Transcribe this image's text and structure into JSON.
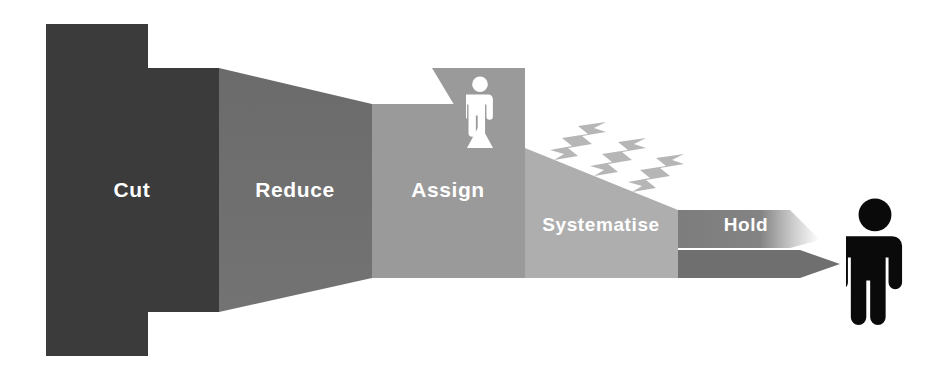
{
  "diagram": {
    "background": "#ffffff",
    "stages": [
      {
        "id": "cut",
        "label": "Cut",
        "color": "#3b3b3b",
        "label_x": 132,
        "label_y": 197
      },
      {
        "id": "reduce",
        "label": "Reduce",
        "color": "#6f6f6f",
        "label_x": 295,
        "label_y": 197
      },
      {
        "id": "assign",
        "label": "Assign",
        "color": "#9a9a9a",
        "label_x": 448,
        "label_y": 197
      },
      {
        "id": "systematise",
        "label": "Systematise",
        "color": "#aeaeae",
        "label_x": 601,
        "label_y": 230
      },
      {
        "id": "hold",
        "label": "Hold",
        "color": "#7d7d7d",
        "label_x": 746,
        "label_y": 230
      }
    ],
    "figures": [
      {
        "id": "small-person",
        "color": "#ffffff",
        "x": 478,
        "y": 74,
        "scale": 0.46
      },
      {
        "id": "large-person",
        "color": "#0a0a0a",
        "x": 873,
        "y": 196,
        "scale": 1.0
      }
    ],
    "bolts": {
      "id": "lightning-bolts",
      "color": "#b6b6b6",
      "count": 3,
      "positions": [
        {
          "x": 560,
          "y": 126
        },
        {
          "x": 600,
          "y": 142
        },
        {
          "x": 638,
          "y": 158
        }
      ]
    },
    "markers": {
      "chevron_notch": "left-notch-arrow",
      "triangle_base": "white-triangle",
      "hold_fade": "#ffffff"
    }
  }
}
